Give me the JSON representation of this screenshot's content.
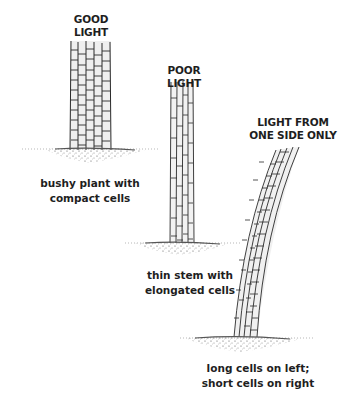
{
  "diagram": {
    "panels": [
      {
        "id": "good-light",
        "title": "GOOD LIGHT",
        "caption_lines": [
          "bushy plant with",
          "compact cells"
        ]
      },
      {
        "id": "poor-light",
        "title": "POOR LIGHT",
        "caption_lines": [
          "thin stem with",
          "elongated cells"
        ]
      },
      {
        "id": "one-side-light",
        "title_lines": [
          "LIGHT FROM",
          "ONE SIDE ONLY"
        ],
        "caption_lines": [
          "long cells on left;",
          "short cells on right"
        ]
      }
    ],
    "colors": {
      "ink": "#2a2a2a",
      "cell_fill": "#ececec",
      "soil": "#6a6a6a"
    }
  }
}
